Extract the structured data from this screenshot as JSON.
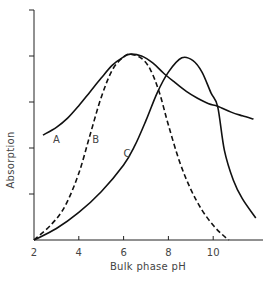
{
  "chart_data": {
    "type": "line",
    "title": "",
    "xlabel": "Bulk phase pH",
    "ylabel": "Absorption",
    "xlim": [
      2,
      12
    ],
    "ylim": [
      0,
      5
    ],
    "x_ticks": [
      2,
      4,
      6,
      8,
      10
    ],
    "x_tick_labels": [
      "2",
      "4",
      "6",
      "8",
      "10"
    ],
    "y_ticks": [
      0,
      1,
      2,
      3,
      4,
      5
    ],
    "y_tick_labels": [
      "",
      "",
      "",
      "",
      "",
      ""
    ],
    "grid": false,
    "legend": "inline curve labels",
    "series": [
      {
        "name": "A",
        "style": "solid",
        "x": [
          2.4,
          3.0,
          3.5,
          4.0,
          4.5,
          5.0,
          5.5,
          6.0,
          6.3,
          6.8,
          7.3,
          7.8,
          8.3,
          8.8,
          9.3,
          9.8,
          10.2,
          10.8,
          11.3,
          11.8
        ],
        "values": [
          2.28,
          2.45,
          2.65,
          2.92,
          3.22,
          3.52,
          3.8,
          3.98,
          4.04,
          4.0,
          3.85,
          3.62,
          3.42,
          3.23,
          3.08,
          2.96,
          2.91,
          2.78,
          2.7,
          2.63
        ]
      },
      {
        "name": "B",
        "style": "dashed",
        "x": [
          2.0,
          2.8,
          3.4,
          4.0,
          4.5,
          5.0,
          5.5,
          6.0,
          6.3,
          6.8,
          7.2,
          7.6,
          8.0,
          8.5,
          9.0,
          9.5,
          10.0,
          10.4,
          10.7
        ],
        "values": [
          0.0,
          0.35,
          0.75,
          1.45,
          2.28,
          3.1,
          3.7,
          3.98,
          4.04,
          3.95,
          3.7,
          3.2,
          2.5,
          1.7,
          1.1,
          0.65,
          0.32,
          0.12,
          0.0
        ]
      },
      {
        "name": "C",
        "style": "solid",
        "x": [
          2.0,
          3.0,
          4.0,
          5.0,
          6.0,
          6.5,
          7.0,
          7.5,
          8.0,
          8.6,
          9.1,
          9.5,
          9.9,
          10.2,
          10.5,
          10.9,
          11.3,
          11.9
        ],
        "values": [
          0.0,
          0.25,
          0.6,
          1.05,
          1.63,
          2.05,
          2.6,
          3.2,
          3.65,
          3.96,
          3.9,
          3.65,
          3.2,
          2.9,
          1.95,
          1.3,
          0.9,
          0.48
        ]
      }
    ],
    "annotations": [
      {
        "text": "A",
        "x": 2.85,
        "y": 2.2
      },
      {
        "text": "B",
        "x": 4.6,
        "y": 2.2
      },
      {
        "text": "C",
        "x": 6.0,
        "y": 1.9
      }
    ]
  },
  "labels": {
    "xlabel": "Bulk phase pH",
    "ylabel": "Absorption",
    "x_ticks": [
      "2",
      "4",
      "6",
      "8",
      "10"
    ],
    "curve_a": "A",
    "curve_b": "B",
    "curve_c": "C"
  }
}
